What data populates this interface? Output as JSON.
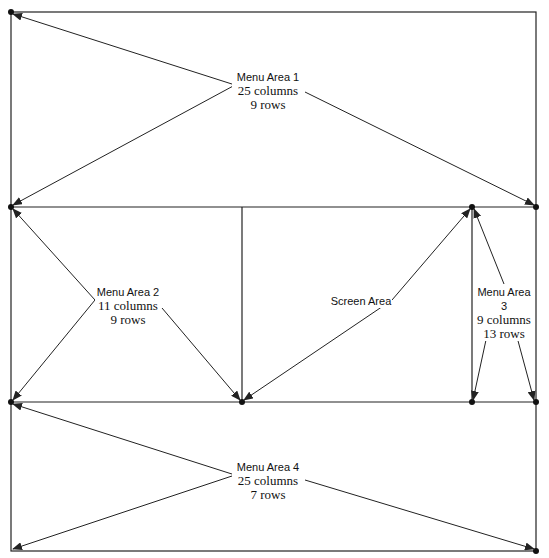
{
  "diagram": {
    "regions": [
      {
        "id": "menu1",
        "title": "Menu Area 1",
        "columns": "25 columns",
        "rows": "9 rows"
      },
      {
        "id": "menu2",
        "title": "Menu Area 2",
        "columns": "11 columns",
        "rows": "9 rows"
      },
      {
        "id": "screen",
        "title": "Screen Area"
      },
      {
        "id": "menu3",
        "title": "Menu Area 3",
        "columns": "9 columns",
        "rows": "13 rows"
      },
      {
        "id": "menu4",
        "title": "Menu Area 4",
        "columns": "25 columns",
        "rows": "7 rows"
      }
    ],
    "colors": {
      "line": "#222222",
      "background": "#ffffff"
    }
  }
}
